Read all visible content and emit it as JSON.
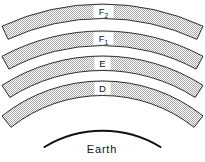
{
  "figure": {
    "layers": [
      {
        "id": "F2",
        "label": "F",
        "subscript": "2"
      },
      {
        "id": "F1",
        "label": "F",
        "subscript": "1"
      },
      {
        "id": "E",
        "label": "E",
        "subscript": ""
      },
      {
        "id": "D",
        "label": "D",
        "subscript": ""
      }
    ],
    "earth_label": "Earth",
    "colors": {
      "background": "#ffffff",
      "outline": "#1a1a1a",
      "halftone_dot": "#a8a8a8",
      "label_box": "#ffffff"
    }
  }
}
